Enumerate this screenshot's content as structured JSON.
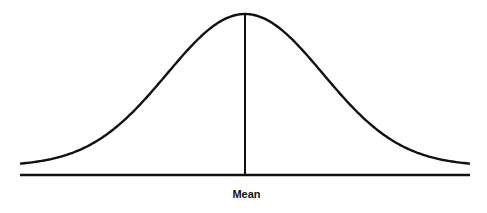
{
  "chart_data": {
    "type": "line",
    "title": "",
    "xlabel": "",
    "ylabel": "",
    "annotations": [
      {
        "text": "Mean",
        "position": "below baseline at center"
      }
    ],
    "curve": {
      "mean_px": 245,
      "peak_y_px": 14,
      "baseline_y_px": 166,
      "sigma_px": 78,
      "x_start_px": 20,
      "x_end_px": 470
    },
    "axis": {
      "y_px": 175,
      "x_start_px": 20,
      "x_end_px": 470
    },
    "grid": false,
    "legend": null,
    "color": "#111111"
  },
  "labels": {
    "mean": "Mean"
  }
}
